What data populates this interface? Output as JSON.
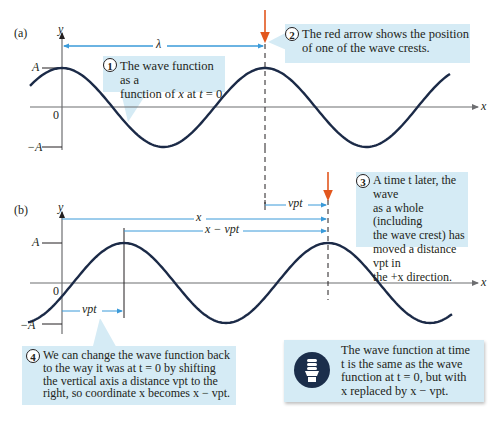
{
  "panel_a": {
    "label": "(a)",
    "y_axis_label": "y",
    "x_axis_label": "x",
    "tick_A": "A",
    "tick_zero": "0",
    "tick_negA": "−A",
    "wavelength_label": "λ",
    "callout_1": {
      "number": "1",
      "line1": "The wave function as a",
      "line2_pre": "function of ",
      "line2_x": "x",
      "line2_mid": " at ",
      "line2_t": "t",
      "line2_post": " = 0"
    },
    "callout_2": {
      "number": "2",
      "line1": "The red arrow shows the position",
      "line2": "of one of the wave crests."
    }
  },
  "panel_b": {
    "label": "(b)",
    "y_axis_label": "y",
    "x_axis_label": "x",
    "tick_A": "A",
    "tick_zero": "0",
    "tick_negA": "−A",
    "x_label": "x",
    "x_minus_vpt_label": "x − vpt",
    "vpt_label": "vpt",
    "callout_3": {
      "number": "3",
      "text_lines": [
        "A time t later, the wave",
        "as a whole (including",
        "the wave crest) has",
        "moved a distance vpt in",
        "the +x direction."
      ]
    },
    "callout_4": {
      "number": "4",
      "text_lines": [
        "We can change the wave function back",
        "to the way it was at t = 0 by shifting",
        "the vertical axis a distance vpt to the",
        "right, so coordinate x becomes x − vpt."
      ]
    }
  },
  "tip": {
    "icon": "lightbulb-icon",
    "text_lines": [
      "The wave function at time",
      "t is the same as the wave",
      "function at t = 0, but with",
      "x replaced by x − vpt."
    ]
  },
  "colors": {
    "wave": "#1b2a47",
    "axis": "#6d6e71",
    "arrow_red": "#e2571e",
    "dimension_blue": "#3a9ad9",
    "callout_bg": "#d5ebf5"
  }
}
